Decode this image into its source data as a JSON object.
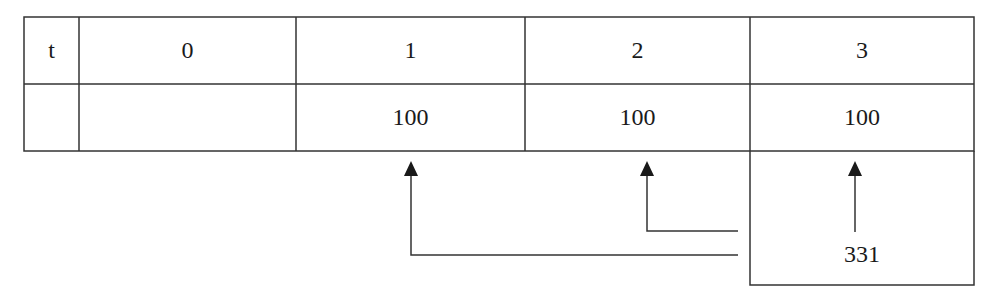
{
  "timeline_table": {
    "header_row": {
      "label": "t",
      "periods": [
        "0",
        "1",
        "2",
        "3"
      ]
    },
    "value_row": {
      "label": "",
      "values": [
        "",
        "100",
        "100",
        "100"
      ]
    }
  },
  "future_value_box": {
    "value": "331"
  },
  "arrows": [
    {
      "from": "future_value_box",
      "to_period": "1"
    },
    {
      "from": "future_value_box",
      "to_period": "2"
    },
    {
      "from": "future_value_box",
      "to_period": "3"
    }
  ],
  "colors": {
    "line": "#333333",
    "text": "#1a1a1a",
    "background": "#ffffff"
  }
}
